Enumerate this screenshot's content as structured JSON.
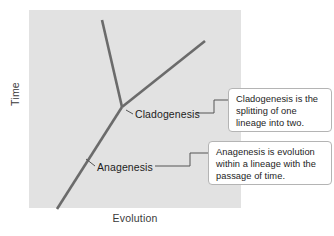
{
  "figure": {
    "type": "diagram",
    "axes": {
      "ylabel": "Time",
      "xlabel": "Evolution"
    },
    "plot_background": "#e2e2e2",
    "line_color": "#6b6b6b",
    "callout_border": "#b4b4b4",
    "labels": [
      {
        "id": "cladogenesis",
        "text": "Cladogenesis"
      },
      {
        "id": "anagenesis",
        "text": "Anagenesis"
      }
    ],
    "callouts": [
      {
        "id": "cladogenesis",
        "lines": [
          "Cladogenesis is the",
          "splitting of one",
          "lineage into two."
        ]
      },
      {
        "id": "anagenesis",
        "lines": [
          "Anagenesis is evolution",
          "within a lineage with the",
          "passage of time."
        ]
      }
    ]
  }
}
